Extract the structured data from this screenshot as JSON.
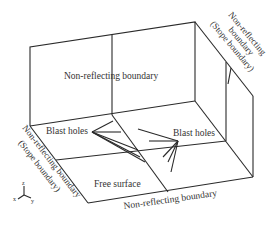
{
  "diagram": {
    "type": "3D model boundary schematic",
    "labels": {
      "back_wall": "Non-reflecting boundary",
      "right_slope_line1": "Non-reflecting",
      "right_slope_line2": "boundary",
      "right_slope_line3": "(Stope boundary)",
      "left_slope_line1": "Non-reflecting boundary",
      "left_slope_line2": "(Stope boundary)",
      "blast_holes_left": "Blast holes",
      "blast_holes_right": "Blast holes",
      "free_surface": "Free surface",
      "front_boundary": "Non-reflecting boundary"
    },
    "axes": {
      "x": "x",
      "y": "y",
      "z": "z"
    },
    "colors": {
      "line": "#2a2a2a",
      "text": "#333333",
      "background": "#ffffff"
    }
  }
}
